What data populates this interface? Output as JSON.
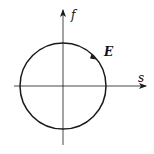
{
  "diagram": {
    "axes": {
      "horizontal_label": "s",
      "vertical_label": "f"
    },
    "curve": {
      "shape": "circle",
      "label": "E",
      "direction": "clockwise"
    },
    "colors": {
      "stroke": "#1a1a1a",
      "background": "#ffffff"
    }
  }
}
